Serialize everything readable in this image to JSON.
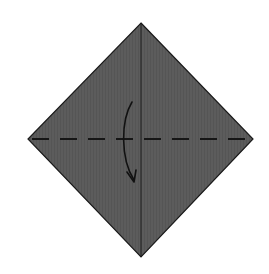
{
  "diagram": {
    "type": "origami-step",
    "colors": {
      "background": "#ffffff",
      "paper": "#5c5c5c",
      "outline": "#1a1a1a",
      "crease": "#1e1e1e",
      "fold_line": "#161616",
      "arrow": "#111111"
    },
    "paper": {
      "top": [
        141,
        23
      ],
      "right": [
        253,
        139
      ],
      "bottom": [
        141,
        257
      ],
      "left": [
        28,
        139
      ]
    },
    "crease_line": {
      "x1": 141,
      "y1": 23,
      "x2": 141,
      "y2": 257,
      "style": "solid"
    },
    "fold_line": {
      "x1": 30,
      "y1": 139,
      "x2": 251,
      "y2": 139,
      "style": "dashed",
      "fold_type": "valley"
    },
    "arrow": {
      "direction": "down",
      "meaning": "fold top corner down to bottom corner"
    }
  }
}
